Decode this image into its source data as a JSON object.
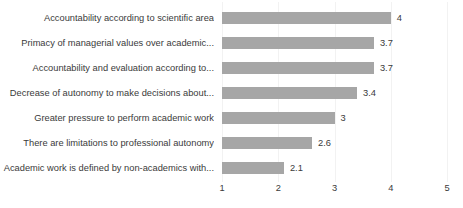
{
  "chart_data": {
    "type": "bar",
    "orientation": "horizontal",
    "title": "",
    "subtitle": "",
    "xlabel": "",
    "ylabel": "",
    "categories": [
      "Accountability according to scientific area",
      "Primacy of managerial values over academic...",
      "Accountability and evaluation according to...",
      "Decrease of autonomy to make decisions about...",
      "Greater pressure to perform academic work",
      "There are limitations to professional autonomy",
      "Academic work is defined by non-academics with..."
    ],
    "values": [
      4,
      3.7,
      3.7,
      3.4,
      3,
      2.6,
      2.1
    ],
    "value_labels": [
      "4",
      "3.7",
      "3.7",
      "3.4",
      "3",
      "2.6",
      "2.1"
    ],
    "xlim": [
      1,
      5
    ],
    "xticks": [
      1,
      2,
      3,
      4,
      5
    ],
    "xtick_labels": [
      "1",
      "2",
      "3",
      "4",
      "5"
    ],
    "bar_origin": 1,
    "grid": true,
    "grid_axis": "x",
    "legend": false,
    "legend_position": "none",
    "colors": {
      "bar": "#a6a6a6",
      "text": "#3a3a3a",
      "gridline": "#f2f2f2",
      "background": "#ffffff"
    }
  }
}
